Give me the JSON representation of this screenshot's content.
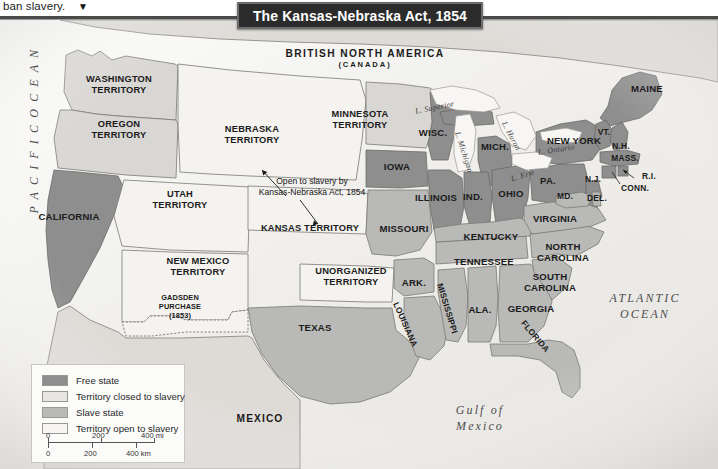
{
  "caption": {
    "text": "ban slavery.",
    "arrow_icon": "▼"
  },
  "title": {
    "text": "The Kansas-Nebraska Act, 1854"
  },
  "legend": {
    "items": [
      {
        "label": "Free state",
        "color": "#8e8e8e"
      },
      {
        "label": "Territory closed to slavery",
        "color": "#e8e6e2"
      },
      {
        "label": "Slave state",
        "color": "#b9b9b7"
      },
      {
        "label": "Territory open to slavery",
        "color": "#f4f3f0"
      }
    ],
    "scale": {
      "miles": {
        "t0": "0",
        "t1": "200",
        "t2": "400 mi"
      },
      "km": {
        "t0": "0",
        "t1": "200",
        "t2": "400 km"
      }
    }
  },
  "annotation": {
    "line1": "Open to slavery by",
    "line2": "Kansas-Nebraska Act, 1854"
  },
  "countries": {
    "canada_line1": "BRITISH NORTH AMERICA",
    "canada_line2": "(CANADA)",
    "mexico": "MEXICO"
  },
  "oceans": {
    "pacific": "P A C I F I C   O C E A N",
    "atlantic_line1": "ATLANTIC",
    "atlantic_line2": "OCEAN",
    "gulf_line1": "Gulf of",
    "gulf_line2": "Mexico"
  },
  "lakes": {
    "superior": "L. Superior",
    "michigan": "L. Michigan",
    "huron": "L. Huron",
    "erie": "L. Erie",
    "ontario": "L. Ontario"
  },
  "territories": {
    "washington_l1": "WASHINGTON",
    "washington_l2": "TERRITORY",
    "oregon_l1": "OREGON",
    "oregon_l2": "TERRITORY",
    "utah_l1": "UTAH",
    "utah_l2": "TERRITORY",
    "new_mexico_l1": "NEW MEXICO",
    "new_mexico_l2": "TERRITORY",
    "nebraska_l1": "NEBRASKA",
    "nebraska_l2": "TERRITORY",
    "kansas": "KANSAS TERRITORY",
    "minnesota_l1": "MINNESOTA",
    "minnesota_l2": "TERRITORY",
    "unorganized_l1": "UNORGANIZED",
    "unorganized_l2": "TERRITORY",
    "gadsden_l1": "GADSDEN",
    "gadsden_l2": "PURCHASE",
    "gadsden_l3": "(1853)"
  },
  "states": {
    "california": "CALIFORNIA",
    "texas": "TEXAS",
    "iowa": "IOWA",
    "wisconsin": "WISC.",
    "michigan": "MICH.",
    "illinois": "ILLINOIS",
    "indiana": "IND.",
    "ohio": "OHIO",
    "missouri": "MISSOURI",
    "arkansas": "ARK.",
    "louisiana": "LOUISIANA",
    "mississippi": "MISSISSIPPI",
    "alabama": "ALA.",
    "georgia": "GEORGIA",
    "florida": "FLORIDA",
    "tennessee": "TENNESSEE",
    "kentucky": "KENTUCKY",
    "virginia": "VIRGINIA",
    "north_carolina_l1": "NORTH",
    "north_carolina_l2": "CAROLINA",
    "south_carolina_l1": "SOUTH",
    "south_carolina_l2": "CAROLINA",
    "maryland": "MD.",
    "delaware": "DEL.",
    "pennsylvania": "PA.",
    "new_jersey": "N.J.",
    "new_york": "NEW YORK",
    "vermont": "VT.",
    "new_hampshire": "N.H.",
    "massachusetts": "MASS.",
    "rhode_island": "R.I.",
    "connecticut": "CONN.",
    "maine": "MAINE"
  },
  "colors": {
    "free_state": "#8e8e8e",
    "slave_state": "#b9b9b7",
    "territory_closed": "#d9d7d3",
    "territory_open": "#f4f3f0",
    "foreign": "#dedbd7",
    "water": "#f2f1ef",
    "border": "#7a7874",
    "title_bg": "#2b2b2b"
  }
}
